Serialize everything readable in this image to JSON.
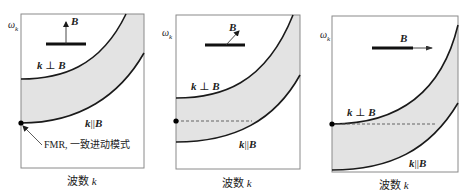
{
  "figure": {
    "colors": {
      "band_fill": "#e3e3e3",
      "frame": "#8a8a8a",
      "curve": "#1a1a1a",
      "dash": "#555555",
      "text": "#222222"
    },
    "y_axis_label": "ω",
    "y_axis_sub": "k",
    "x_axis_label_cn": "波数",
    "x_axis_label_var": "k",
    "perp_label": {
      "k": "k",
      "op": "⊥",
      "B": "B"
    },
    "par_label": {
      "k": "k",
      "op": "||",
      "B": "B"
    },
    "field_label": "B",
    "fmr_annotation": "FMR, 一致进动模式"
  },
  "panels": [
    {
      "id": "panel-1-field-out-of-plane",
      "frame": {
        "x": 21,
        "y": 14,
        "w": 123,
        "h": 154
      },
      "band_path": "M21,79 C60,79 100,68 126,14 L144,14 L144,53 C120,95 80,123 21,123 Z",
      "upper_curve": "M21,79 C60,79 100,68 126,14",
      "lower_curve": "M21,123 C80,123 120,95 144,53",
      "dashed": null,
      "fmr_dot": {
        "cx": 21,
        "cy": 123
      },
      "magnet_bar": {
        "x1": 46,
        "y1": 44,
        "x2": 86,
        "y2": 44
      },
      "field_arrow": {
        "x1": 66,
        "y1": 44,
        "x2": 66,
        "y2": 22
      },
      "field_label_pos": {
        "x": 71,
        "y": 25
      },
      "omega_pos": {
        "x": 8,
        "y": 28
      },
      "perp_label_pos": {
        "x": 37,
        "y": 69
      },
      "par_label_pos": {
        "x": 85,
        "y": 127
      },
      "xlabel_pos": {
        "x": 67,
        "y": 185
      },
      "fmr_arrow": {
        "x1": 42,
        "y1": 145,
        "x2": 23,
        "y2": 126
      },
      "fmr_label_pos": {
        "x": 44,
        "y": 148
      }
    },
    {
      "id": "panel-2-field-oblique",
      "frame": {
        "x": 176,
        "y": 15,
        "w": 124,
        "h": 154
      },
      "band_path": "M176,98 C220,98 265,85 293,15 L300,15 L300,75 C275,120 235,142 176,142 Z",
      "upper_curve": "M176,98 C220,98 265,85 293,15",
      "lower_curve": "M176,142 C235,142 275,120 300,75",
      "dashed": {
        "x1": 176,
        "y1": 121,
        "x2": 252,
        "y2": 121
      },
      "fmr_dot": {
        "cx": 176,
        "cy": 121
      },
      "magnet_bar": {
        "x1": 205,
        "y1": 45,
        "x2": 245,
        "y2": 45
      },
      "field_arrow": {
        "x1": 226,
        "y1": 45,
        "x2": 239,
        "y2": 31
      },
      "field_label_pos": {
        "x": 229,
        "y": 31
      },
      "omega_pos": {
        "x": 162,
        "y": 36
      },
      "perp_label_pos": {
        "x": 191,
        "y": 90
      },
      "par_label_pos": {
        "x": 239,
        "y": 148
      },
      "xlabel_pos": {
        "x": 222,
        "y": 187
      }
    },
    {
      "id": "panel-3-field-in-plane",
      "frame": {
        "x": 332,
        "y": 16,
        "w": 126,
        "h": 156
      },
      "band_path": "M332,124 C390,124 440,100 458,25 L458,103 C430,150 390,170 332,170 Z",
      "upper_curve": "M332,124 C390,124 440,100 458,25",
      "lower_curve": "M332,170 C390,170 430,150 458,103",
      "dashed": {
        "x1": 332,
        "y1": 124,
        "x2": 437,
        "y2": 124
      },
      "fmr_dot": {
        "cx": 332,
        "cy": 124
      },
      "magnet_bar": {
        "x1": 372,
        "y1": 48,
        "x2": 413,
        "y2": 48
      },
      "field_arrow": {
        "x1": 413,
        "y1": 48,
        "x2": 432,
        "y2": 48
      },
      "field_label_pos": {
        "x": 400,
        "y": 42
      },
      "omega_pos": {
        "x": 320,
        "y": 38
      },
      "perp_label_pos": {
        "x": 347,
        "y": 116
      },
      "par_label_pos": {
        "x": 409,
        "y": 167
      },
      "xlabel_pos": {
        "x": 379,
        "y": 189
      }
    }
  ]
}
